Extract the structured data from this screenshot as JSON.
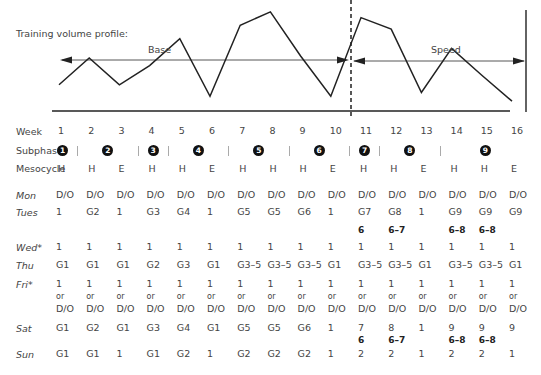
{
  "chart": {
    "title": "Training volume profile:",
    "phases": [
      {
        "label": "Base",
        "from_week": 1,
        "to_week": 10
      },
      {
        "label": "Speed",
        "from_week": 11,
        "to_week": 16
      }
    ],
    "stroke_color": "#222222",
    "dashed_divider_color": "#111111"
  },
  "chart_data": {
    "type": "line",
    "title": "Training volume profile:",
    "xlabel": "Week",
    "ylabel": "",
    "x": [
      1,
      2,
      3,
      4,
      5,
      6,
      7,
      8,
      9,
      10,
      11,
      12,
      13,
      14,
      15,
      16
    ],
    "series": [
      {
        "name": "Volume (relative)",
        "values": [
          20,
          48,
          20,
          40,
          68,
          8,
          82,
          96,
          50,
          8,
          90,
          78,
          12,
          58,
          30,
          3
        ]
      }
    ],
    "annotations": [
      "Base (weeks 1–10)",
      "Speed (weeks 11–16)",
      "Dashed divider between week 10 and 11"
    ],
    "grid": false,
    "legend": "none"
  },
  "table": {
    "weeks_label": "Week",
    "weeks": [
      "1",
      "2",
      "3",
      "4",
      "5",
      "6",
      "7",
      "8",
      "9",
      "10",
      "11",
      "12",
      "13",
      "14",
      "15",
      "16"
    ],
    "subphase_label": "Subphase",
    "subphases": [
      {
        "num": "1",
        "week_pos": 1.0
      },
      {
        "num": "2",
        "week_pos": 2.5
      },
      {
        "num": "3",
        "week_pos": 4.0
      },
      {
        "num": "4",
        "week_pos": 5.5
      },
      {
        "num": "5",
        "week_pos": 7.5
      },
      {
        "num": "6",
        "week_pos": 9.5
      },
      {
        "num": "7",
        "week_pos": 11.0
      },
      {
        "num": "8",
        "week_pos": 12.5
      },
      {
        "num": "9",
        "week_pos": 15.0
      }
    ],
    "subphase_separators": [
      1.5,
      3.5,
      4.5,
      6.5,
      8.5,
      10.5,
      11.5,
      13.5
    ],
    "mesocycle_label": "Mesocycle",
    "mesocycles": [
      "H",
      "H",
      "E",
      "H",
      "H",
      "E",
      "H",
      "H",
      "H",
      "E",
      "H",
      "H",
      "E",
      "H",
      "H",
      "E"
    ],
    "days": [
      {
        "label": "Mon",
        "values": [
          "D/O",
          "D/O",
          "D/O",
          "D/O",
          "D/O",
          "D/O",
          "D/O",
          "D/O",
          "D/O",
          "D/O",
          "D/O",
          "D/O",
          "D/O",
          "D/O",
          "D/O",
          "D/O"
        ]
      },
      {
        "label": "Tues",
        "values": [
          "1",
          "G2",
          "1",
          "G3",
          "G4",
          "1",
          "G5",
          "G5",
          "G6",
          "1",
          "G7",
          "G8",
          "1",
          "G9",
          "G9",
          "G9"
        ],
        "bold": [
          "",
          "",
          "",
          "",
          "",
          "",
          "",
          "",
          "",
          "",
          "6",
          "6–7",
          "",
          "6–8",
          "6–8",
          ""
        ]
      },
      {
        "label": "Wed*",
        "values": [
          "1",
          "1",
          "1",
          "1",
          "1",
          "1",
          "1",
          "1",
          "1",
          "1",
          "1",
          "1",
          "1",
          "1",
          "1",
          "1"
        ]
      },
      {
        "label": "Thu",
        "values": [
          "G1",
          "G1",
          "G1",
          "G2",
          "G3",
          "G1",
          "G3–5",
          "G3–5",
          "G3–5",
          "G1",
          "G3–5",
          "G3–5",
          "G1",
          "G3–5",
          "G3–5",
          "G1"
        ]
      },
      {
        "label": "Fri*",
        "values": [
          "1",
          "1",
          "1",
          "1",
          "1",
          "1",
          "1",
          "1",
          "1",
          "1",
          "1",
          "1",
          "1",
          "1",
          "1",
          "1"
        ],
        "or": "or",
        "alt": "D/O"
      },
      {
        "label": "Sat",
        "values": [
          "G1",
          "G2",
          "G1",
          "G3",
          "G4",
          "G1",
          "G5",
          "G5",
          "G6",
          "1",
          "7",
          "8",
          "1",
          "9",
          "9",
          "9"
        ],
        "bold": [
          "",
          "",
          "",
          "",
          "",
          "",
          "",
          "",
          "",
          "",
          "6",
          "6–7",
          "",
          "6–8",
          "6–8",
          ""
        ]
      },
      {
        "label": "Sun",
        "values": [
          "G1",
          "G1",
          "1",
          "G1",
          "G2",
          "1",
          "G2",
          "G2",
          "G2",
          "1",
          "2",
          "2",
          "1",
          "2",
          "2",
          "1"
        ]
      }
    ]
  }
}
